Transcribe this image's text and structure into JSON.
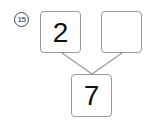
{
  "problem": {
    "number": "15",
    "top_left_value": "2",
    "top_right_value": "",
    "bottom_value": "7"
  }
}
